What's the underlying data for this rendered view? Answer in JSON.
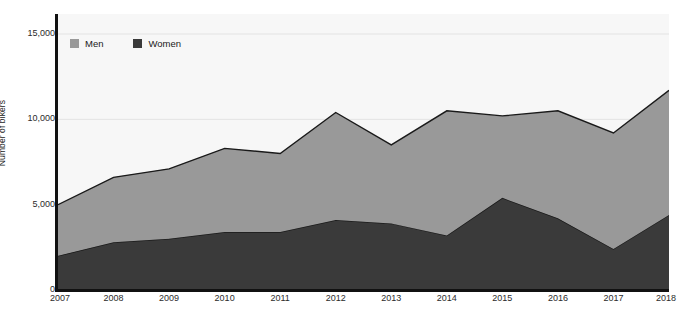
{
  "chart_data": {
    "type": "area",
    "stacked": true,
    "title": "",
    "subtitle": "",
    "xlabel": "",
    "ylabel": "Number of bikers",
    "categories": [
      "2007",
      "2008",
      "2009",
      "2010",
      "2011",
      "2012",
      "2013",
      "2014",
      "2015",
      "2016",
      "2017",
      "2018"
    ],
    "series": [
      {
        "name": "Women",
        "color": "#3a3a3a",
        "values": [
          2000,
          2800,
          3000,
          3400,
          3400,
          4100,
          3900,
          3200,
          5400,
          4200,
          2400,
          4400
        ]
      },
      {
        "name": "Men",
        "color": "#999999",
        "values": [
          3000,
          3800,
          4100,
          4900,
          4600,
          6300,
          4600,
          7300,
          4800,
          6300,
          6800,
          7300
        ]
      }
    ],
    "totals": [
      5000,
      6600,
      7100,
      8300,
      8000,
      10400,
      8500,
      10500,
      10200,
      10500,
      9200,
      11700
    ],
    "ylim": [
      0,
      15000
    ],
    "y_ticks": [
      0,
      5000,
      10000,
      15000
    ],
    "y_tick_labels": [
      "0",
      "5,000",
      "10,000",
      "15,000"
    ],
    "x_tick_labels": [
      "2007",
      "2008",
      "2009",
      "2010",
      "2011",
      "2012",
      "2013",
      "2014",
      "2015",
      "2016",
      "2017",
      "2018"
    ],
    "grid": true,
    "grid_color": "#e3e3e3",
    "plot_background": "#f7f7f7",
    "axis_color": "#111111",
    "legend": {
      "position": "top-left-inside",
      "entries": [
        {
          "label": "Men",
          "color": "#999999"
        },
        {
          "label": "Women",
          "color": "#3a3a3a"
        }
      ]
    }
  }
}
